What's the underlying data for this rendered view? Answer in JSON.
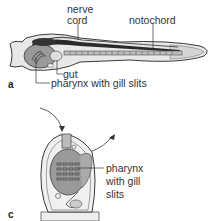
{
  "figure": {
    "panel_a": {
      "letter": "a",
      "subject": "lancelet",
      "labels": {
        "nerve": "nerve",
        "cord": "cord",
        "notochord": "notochord",
        "gut": "gut",
        "pharynx": "pharynx with gill slits"
      }
    },
    "panel_c": {
      "letter": "c",
      "subject": "tunicate",
      "labels": {
        "line1": "pharynx",
        "line2": "with gill",
        "line3": "slits"
      }
    }
  },
  "colors": {
    "outline": "#3a3a3a",
    "body_fill": "#e6e6e6",
    "organ_fill": "#9a9a9a",
    "dark_fill": "#2a2a2a"
  }
}
